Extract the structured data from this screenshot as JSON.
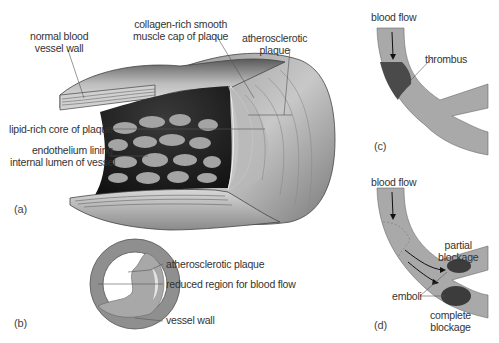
{
  "figure": {
    "panels": {
      "a": {
        "tag": "(a)",
        "labels": {
          "normal_wall_1": "normal blood",
          "normal_wall_2": "vessel wall",
          "cap_1": "collagen-rich smooth",
          "cap_2": "muscle cap of plaque",
          "plaque_1": "atherosclerotic",
          "plaque_2": "plaque",
          "lipid_core": "lipid-rich core of plaque",
          "endothelium_1": "endothelium lining",
          "endothelium_2": "internal lumen of vessel"
        }
      },
      "b": {
        "tag": "(b)",
        "labels": {
          "plaque": "atherosclerotic plaque",
          "reduced": "reduced region for blood flow",
          "wall": "vessel wall"
        }
      },
      "c": {
        "tag": "(c)",
        "labels": {
          "flow": "blood flow",
          "thrombus": "thrombus"
        }
      },
      "d": {
        "tag": "(d)",
        "labels": {
          "flow": "blood flow",
          "partial_1": "partial",
          "partial_2": "blockage",
          "emboli": "emboli",
          "complete_1": "complete",
          "complete_2": "blockage"
        }
      }
    },
    "colors": {
      "vessel_gray": "#a9a9a9",
      "vessel_dark": "#7f7f7f",
      "clot": "#4a4a4a",
      "lumen_dark": "#1e1e1e",
      "cells": "#a8a8a8",
      "outline": "#555555"
    }
  }
}
